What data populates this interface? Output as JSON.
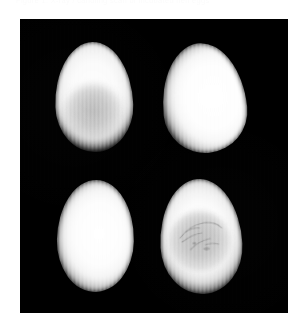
{
  "caption": {
    "text": "Figure 1.  X-ray / candling scan of incubated hen eggs"
  },
  "panel": {
    "background_color": "#000000",
    "width": 268,
    "height": 294,
    "artifact": "vertical-scan-line-striping"
  },
  "image_data": {
    "type": "grayscale-radiograph",
    "modality": "egg candling / soft X-ray",
    "layout": "2x2-grid",
    "background_color": "#000000",
    "specimen_color": "#fafafa",
    "yolk_color": "#b8b8b8",
    "specimen_count": 4,
    "specimens": [
      {
        "position": "top-left",
        "label": "Egg A",
        "shape": "broad-oval",
        "brightness": "bright",
        "internal_structure": "dark-yolk-mass",
        "yolk_visible": true,
        "yolk_position": "lower-center",
        "veins_visible": false,
        "x": 35,
        "y": 23,
        "w": 78,
        "h": 110,
        "rotation_deg": -2
      },
      {
        "position": "top-right",
        "label": "Egg B",
        "shape": "tapered-oval",
        "brightness": "uniformly-bright",
        "internal_structure": "none",
        "yolk_visible": false,
        "veins_visible": false,
        "x": 142,
        "y": 24,
        "w": 84,
        "h": 110,
        "rotation_deg": -6
      },
      {
        "position": "bottom-left",
        "label": "Egg C",
        "shape": "rounded-oval",
        "brightness": "uniformly-bright",
        "internal_structure": "none",
        "yolk_visible": false,
        "veins_visible": false,
        "x": 37,
        "y": 161,
        "w": 77,
        "h": 112,
        "rotation_deg": 1
      },
      {
        "position": "bottom-right",
        "label": "Egg D",
        "shape": "broad-oval",
        "brightness": "bright",
        "internal_structure": "dark-yolk-mass-with-vasculature",
        "yolk_visible": true,
        "yolk_position": "center",
        "veins_visible": true,
        "x": 140,
        "y": 160,
        "w": 82,
        "h": 115,
        "rotation_deg": -3
      }
    ]
  }
}
